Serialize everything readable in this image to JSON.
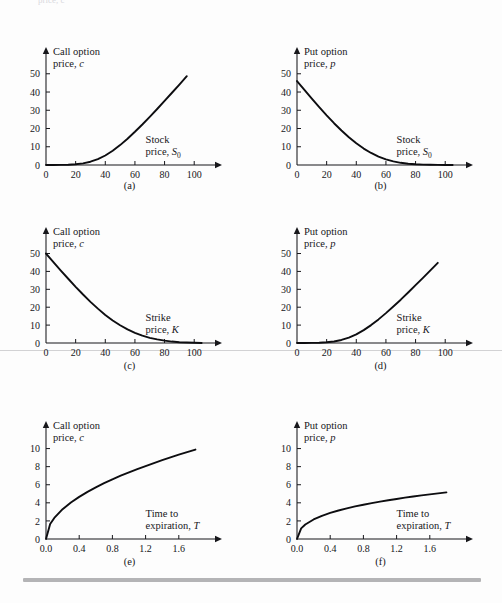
{
  "figure": {
    "background_color": "#fdfdfd",
    "curve_color": "#0d0d10",
    "axis_color": "#17171b",
    "top_cut_text": "price, c",
    "panel_captions": [
      "(a)",
      "(b)",
      "(c)",
      "(d)",
      "(e)",
      "(f)"
    ]
  },
  "chart_data": [
    {
      "type": "line",
      "panel": "(a)",
      "title": "",
      "ylabel_line1": "Call option",
      "ylabel_line2": "price, c",
      "xlabel_line1": "Stock",
      "xlabel_line2": "price, S0",
      "xlabel_symbol": "S",
      "xlabel_subscript": "0",
      "xticks": [
        0,
        20,
        40,
        60,
        80,
        100
      ],
      "yticks": [
        0,
        10,
        20,
        30,
        40,
        50
      ],
      "xlim": [
        0,
        112
      ],
      "ylim": [
        0,
        57
      ],
      "grid": false,
      "legend": "none",
      "x": [
        0,
        5,
        10,
        15,
        20,
        25,
        30,
        35,
        40,
        45,
        50,
        55,
        60,
        65,
        70,
        75,
        80,
        85,
        90,
        95
      ],
      "values": [
        0.0,
        0.0,
        0.05,
        0.15,
        0.4,
        0.9,
        1.8,
        3.2,
        5.2,
        7.8,
        10.9,
        14.4,
        18.2,
        22.2,
        26.4,
        30.7,
        35.1,
        39.6,
        44.1,
        48.7
      ]
    },
    {
      "type": "line",
      "panel": "(b)",
      "title": "",
      "ylabel_line1": "Put option",
      "ylabel_line2": "price, p",
      "xlabel_line1": "Stock",
      "xlabel_line2": "price, S0",
      "xlabel_symbol": "S",
      "xlabel_subscript": "0",
      "xticks": [
        0,
        20,
        40,
        60,
        80,
        100
      ],
      "yticks": [
        0,
        10,
        20,
        30,
        40,
        50
      ],
      "xlim": [
        0,
        112
      ],
      "ylim": [
        0,
        57
      ],
      "grid": false,
      "legend": "none",
      "x": [
        0,
        5,
        10,
        15,
        20,
        25,
        30,
        35,
        40,
        45,
        50,
        55,
        60,
        65,
        70,
        75,
        80,
        85,
        90,
        95,
        100,
        105
      ],
      "values": [
        46.0,
        41.2,
        36.4,
        31.7,
        27.2,
        22.9,
        18.9,
        15.2,
        11.9,
        9.0,
        6.6,
        4.6,
        3.1,
        2.0,
        1.2,
        0.7,
        0.4,
        0.2,
        0.1,
        0.05,
        0.0,
        0.0
      ]
    },
    {
      "type": "line",
      "panel": "(c)",
      "title": "",
      "ylabel_line1": "Call option",
      "ylabel_line2": "price, c",
      "xlabel_line1": "Strike",
      "xlabel_line2": "price, K",
      "xlabel_symbol": "K",
      "xlabel_subscript": "",
      "xticks": [
        0,
        20,
        40,
        60,
        80,
        100
      ],
      "yticks": [
        0,
        10,
        20,
        30,
        40,
        50
      ],
      "xlim": [
        0,
        112
      ],
      "ylim": [
        0,
        57
      ],
      "grid": false,
      "legend": "none",
      "x": [
        0,
        5,
        10,
        15,
        20,
        25,
        30,
        35,
        40,
        45,
        50,
        55,
        60,
        65,
        70,
        75,
        80,
        85,
        90,
        95,
        100,
        105
      ],
      "values": [
        50.0,
        45.2,
        40.5,
        35.9,
        31.4,
        27.1,
        23.0,
        19.2,
        15.7,
        12.6,
        9.9,
        7.6,
        5.7,
        4.1,
        2.9,
        2.0,
        1.3,
        0.8,
        0.45,
        0.25,
        0.1,
        0.0
      ]
    },
    {
      "type": "line",
      "panel": "(d)",
      "title": "",
      "ylabel_line1": "Put option",
      "ylabel_line2": "price, p",
      "xlabel_line1": "Strike",
      "xlabel_line2": "price, K",
      "xlabel_symbol": "K",
      "xlabel_subscript": "",
      "xticks": [
        0,
        20,
        40,
        60,
        80,
        100
      ],
      "yticks": [
        0,
        10,
        20,
        30,
        40,
        50
      ],
      "xlim": [
        0,
        112
      ],
      "ylim": [
        0,
        57
      ],
      "grid": false,
      "legend": "none",
      "x": [
        0,
        5,
        10,
        15,
        20,
        25,
        30,
        35,
        40,
        45,
        50,
        55,
        60,
        65,
        70,
        75,
        80,
        85,
        90,
        95
      ],
      "values": [
        0.0,
        0.0,
        0.05,
        0.15,
        0.4,
        0.85,
        1.7,
        3.0,
        4.8,
        7.2,
        10.0,
        13.2,
        16.7,
        20.4,
        24.2,
        28.2,
        32.3,
        36.4,
        40.6,
        44.8
      ]
    },
    {
      "type": "line",
      "panel": "(e)",
      "title": "",
      "ylabel_line1": "Call option",
      "ylabel_line2": "price, c",
      "xlabel_line1": "Time to",
      "xlabel_line2": "expiration, T",
      "xlabel_symbol": "T",
      "xlabel_subscript": "",
      "xticks": [
        "0.0",
        "0.4",
        "0.8",
        "1.2",
        "1.6"
      ],
      "xtick_values": [
        0.0,
        0.4,
        0.8,
        1.2,
        1.6
      ],
      "yticks": [
        0,
        2,
        4,
        6,
        8,
        10
      ],
      "xlim": [
        0,
        2.0
      ],
      "ylim": [
        0,
        11.5
      ],
      "grid": false,
      "legend": "none",
      "x": [
        0.0,
        0.05,
        0.1,
        0.2,
        0.3,
        0.4,
        0.5,
        0.6,
        0.7,
        0.8,
        0.9,
        1.0,
        1.1,
        1.2,
        1.3,
        1.4,
        1.5,
        1.6,
        1.7,
        1.8
      ],
      "values": [
        0.0,
        1.65,
        2.33,
        3.3,
        4.04,
        4.66,
        5.21,
        5.71,
        6.17,
        6.6,
        7.0,
        7.37,
        7.73,
        8.07,
        8.4,
        8.72,
        9.03,
        9.32,
        9.61,
        9.89
      ]
    },
    {
      "type": "line",
      "panel": "(f)",
      "title": "",
      "ylabel_line1": "Put option",
      "ylabel_line2": "price, p",
      "xlabel_line1": "Time to",
      "xlabel_line2": "expiration, T",
      "xlabel_symbol": "T",
      "xlabel_subscript": "",
      "xticks": [
        "0.0",
        "0.4",
        "0.8",
        "1.2",
        "1.6"
      ],
      "xtick_values": [
        0.0,
        0.4,
        0.8,
        1.2,
        1.6
      ],
      "yticks": [
        0,
        2,
        4,
        6,
        8,
        10
      ],
      "xlim": [
        0,
        2.0
      ],
      "ylim": [
        0,
        11.5
      ],
      "grid": false,
      "legend": "none",
      "x": [
        0.0,
        0.05,
        0.1,
        0.2,
        0.3,
        0.4,
        0.5,
        0.6,
        0.7,
        0.8,
        0.9,
        1.0,
        1.1,
        1.2,
        1.3,
        1.4,
        1.5,
        1.6,
        1.7,
        1.8
      ],
      "values": [
        0.0,
        1.18,
        1.6,
        2.16,
        2.56,
        2.88,
        3.15,
        3.39,
        3.6,
        3.79,
        3.97,
        4.13,
        4.29,
        4.43,
        4.57,
        4.7,
        4.82,
        4.94,
        5.05,
        5.16
      ]
    }
  ]
}
